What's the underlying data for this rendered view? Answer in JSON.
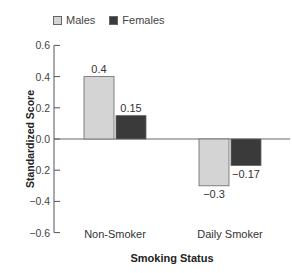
{
  "legend": [
    {
      "label": "Males",
      "color": "#d4d4d4"
    },
    {
      "label": "Females",
      "color": "#3a3a3a"
    }
  ],
  "axes": {
    "ylabel": "Standardized Score",
    "xlabel": "Smoking Status"
  },
  "chart_data": {
    "type": "bar",
    "title": "",
    "categories": [
      "Non-Smoker",
      "Daily Smoker"
    ],
    "series": [
      {
        "name": "Males",
        "values": [
          0.4,
          -0.3
        ],
        "labels": [
          "0.4",
          "−0.3"
        ],
        "color": "#d4d4d4"
      },
      {
        "name": "Females",
        "values": [
          0.15,
          -0.17
        ],
        "labels": [
          "0.15",
          "−0.17"
        ],
        "color": "#3a3a3a"
      }
    ],
    "xlabel": "Smoking Status",
    "ylabel": "Standardized Score",
    "ylim": [
      -0.6,
      0.6
    ],
    "yticks": [
      0.6,
      0.4,
      0.2,
      0.0,
      -0.2,
      -0.4,
      -0.6
    ],
    "ytick_labels": [
      "0.6",
      "0.4",
      "0.2",
      "0.0",
      "−0.2",
      "−0.4",
      "−0.6"
    ],
    "grid": false,
    "legend_position": "top-left"
  }
}
